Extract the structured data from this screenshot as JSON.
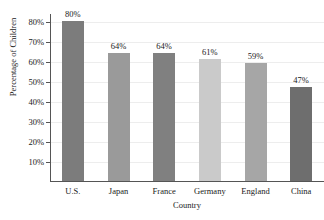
{
  "chart_data": {
    "type": "bar",
    "title": "",
    "xlabel": "Country",
    "ylabel": "Percentage of Children",
    "categories": [
      "U.S.",
      "Japan",
      "France",
      "Germany",
      "England",
      "China"
    ],
    "values": [
      80,
      64,
      64,
      61,
      59,
      47
    ],
    "value_labels": [
      "80%",
      "64%",
      "64%",
      "61%",
      "59%",
      "47%"
    ],
    "bar_colors": [
      "#7c7c7c",
      "#9a9a9a",
      "#808080",
      "#cacaca",
      "#a6a6a6",
      "#6e6e6e"
    ],
    "ylim": [
      0,
      84
    ],
    "yticks": [
      10,
      20,
      30,
      40,
      50,
      60,
      70,
      80
    ],
    "ytick_labels": [
      "10%",
      "20%",
      "30%",
      "40%",
      "50%",
      "60%",
      "70%",
      "80%"
    ],
    "grid": true,
    "legend": null,
    "legend_position": "none"
  },
  "axes": {
    "y_title": "Percentage of Children",
    "x_title": "Country"
  }
}
